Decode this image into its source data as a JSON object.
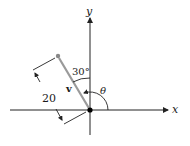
{
  "diagram": {
    "axes": {
      "x_label": "x",
      "y_label": "y"
    },
    "vector": {
      "label": "v",
      "magnitude_label": "20",
      "angle_from_y_label": "30°",
      "angle_from_x_label": "θ",
      "color": "#9a9a9a"
    },
    "colors": {
      "axis": "#222222",
      "vector": "#9a9a9a",
      "tip_dot": "#888888",
      "origin_dot": "#000000"
    }
  }
}
